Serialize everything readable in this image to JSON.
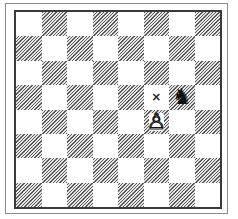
{
  "board": {
    "files": [
      "a",
      "b",
      "c",
      "d",
      "e",
      "f",
      "g",
      "h"
    ],
    "ranks": [
      8,
      7,
      6,
      5,
      4,
      3,
      2,
      1
    ],
    "top_left_square_color": "light",
    "colors": {
      "light": "#ffffff",
      "dark_hatch": "#5a5a5a",
      "border": "#3a3a3a",
      "frame": "#8a8a8a"
    }
  },
  "pieces": [
    {
      "square": "g5",
      "type": "knight",
      "color": "black",
      "glyph": "♞"
    },
    {
      "square": "f4",
      "type": "pawn",
      "color": "white",
      "glyph": "♙"
    }
  ],
  "markers": [
    {
      "square": "f5",
      "type": "cross",
      "glyph": "×"
    }
  ]
}
